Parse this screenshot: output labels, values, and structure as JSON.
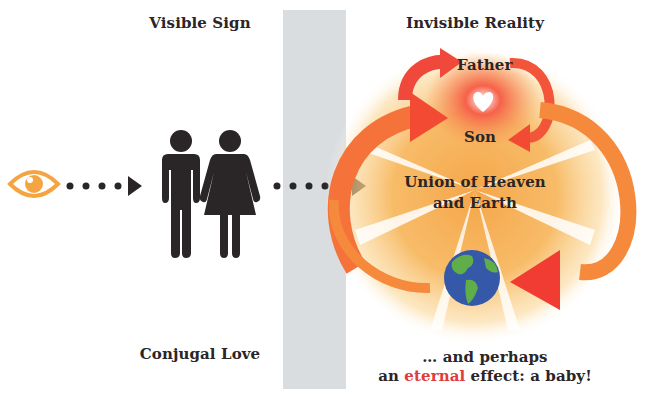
{
  "left_panel": {
    "heading": "Visible Sign",
    "caption": "Conjugal Love",
    "icons": [
      "eye-icon",
      "man-icon",
      "woman-icon"
    ]
  },
  "right_panel": {
    "heading": "Invisible Reality",
    "labels": {
      "father": "Father",
      "son": "Son",
      "union_line1": "Union of Heaven",
      "union_line2": "and Earth"
    },
    "caption": {
      "line1": "… and perhaps",
      "line2_pre": "an ",
      "line2_highlight": "eternal",
      "line2_post": " effect: a baby!"
    },
    "icons": [
      "heart-icon",
      "globe-icon",
      "curved-arrow-icon"
    ]
  },
  "colors": {
    "divider_gray": "#d9dde0",
    "eye_orange": "#f5a442",
    "figure_dark": "#2a2526",
    "arrow_red": "#f04a35",
    "arrow_orange": "#f58a3c",
    "glow_orange": "#f7b55a",
    "highlight_red": "#e23b3b",
    "globe_blue": "#3558a8",
    "globe_green": "#5fae4a"
  }
}
